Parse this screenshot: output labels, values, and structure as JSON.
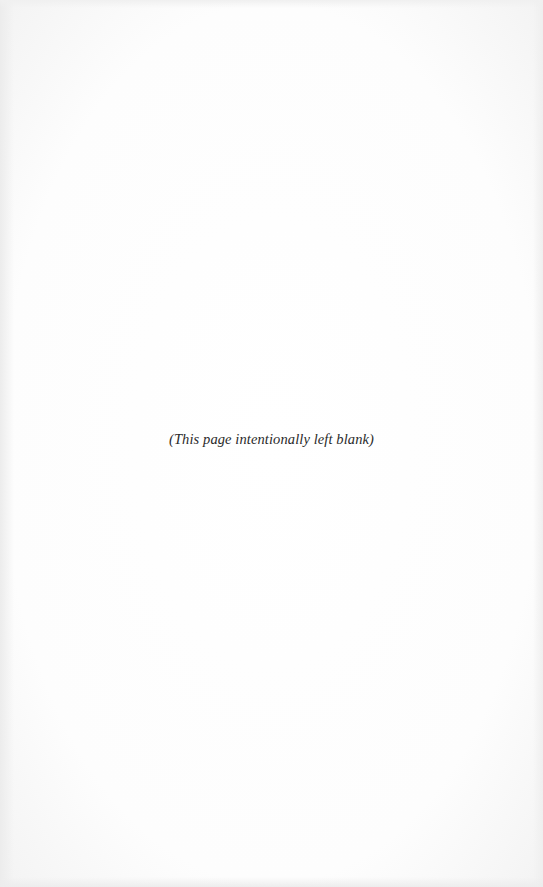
{
  "page": {
    "notice": "(This page intentionally left blank)",
    "background_color": "#fefefe",
    "text_color": "#2a2a2a"
  }
}
